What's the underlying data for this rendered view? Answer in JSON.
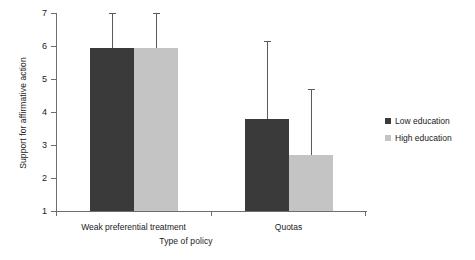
{
  "chart_data": {
    "type": "bar",
    "title": "",
    "xlabel": "Type of policy",
    "ylabel": "Support for affirmative action",
    "categories": [
      "Weak preferential treatment",
      "Quotas"
    ],
    "ylim": [
      1,
      7
    ],
    "yticks": [
      1,
      2,
      3,
      4,
      5,
      6,
      7
    ],
    "ytick_labels": [
      "1",
      "2",
      "3",
      "4",
      "5",
      "6",
      "7"
    ],
    "grid": false,
    "legend_position": "right",
    "series": [
      {
        "name": "Low education",
        "color": "#3a3a3a",
        "values": [
          5.95,
          3.8
        ],
        "error_upper": [
          7.0,
          6.15
        ]
      },
      {
        "name": "High education",
        "color": "#c4c4c4",
        "values": [
          5.95,
          2.7
        ],
        "error_upper": [
          7.0,
          4.7
        ]
      }
    ]
  },
  "legend": {
    "items": [
      {
        "label": "Low education",
        "swatch": "low"
      },
      {
        "label": "High education",
        "swatch": "high"
      }
    ]
  }
}
